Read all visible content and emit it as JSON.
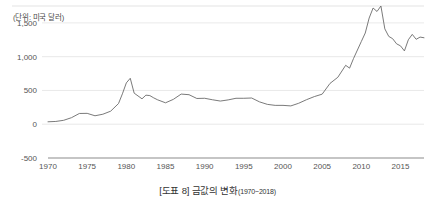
{
  "figure": {
    "unit_label": "(단위: 미국 달러)",
    "caption_main": "[도표 8] 금값의 변화",
    "caption_range": "(1970~2018)"
  },
  "colors": {
    "line": "#6b6b6b",
    "grid": "#e3e3e3",
    "axis": "#8c8c8c",
    "text": "#555555",
    "background": "#ffffff"
  },
  "chart_data": {
    "type": "line",
    "title": "[도표 8] 금값의 변화(1970~2018)",
    "subtitle": "",
    "xlabel": "",
    "ylabel": "(단위: 미국 달러)",
    "unit": "미국 달러",
    "grid": true,
    "legend": false,
    "xlim": [
      1970,
      2018
    ],
    "ylim": [
      -500,
      1750
    ],
    "yticks": [
      -500,
      0,
      500,
      1000,
      1500
    ],
    "ytick_labels": [
      "-500",
      "0",
      "500",
      "1,000",
      "1,500"
    ],
    "xticks": [
      1970,
      1975,
      1980,
      1985,
      1990,
      1995,
      2000,
      2005,
      2010,
      2015
    ],
    "xtick_labels": [
      "1970",
      "1975",
      "1980",
      "1985",
      "1990",
      "1995",
      "2000",
      "2005",
      "2010",
      "2015"
    ],
    "series": [
      {
        "name": "금값",
        "x": [
          1970,
          1971,
          1972,
          1973,
          1974,
          1975,
          1976,
          1977,
          1978,
          1979,
          1979.5,
          1980,
          1980.5,
          1981,
          1982,
          1982.5,
          1983,
          1983.5,
          1984,
          1985,
          1986,
          1987,
          1988,
          1989,
          1990,
          1991,
          1992,
          1993,
          1994,
          1995,
          1996,
          1997,
          1998,
          1999,
          2000,
          2001,
          2002,
          2003,
          2004,
          2005,
          2006,
          2007,
          2008,
          2008.5,
          2009,
          2010,
          2010.5,
          2011,
          2011.5,
          2012,
          2012.5,
          2013,
          2013.5,
          2014,
          2014.5,
          2015,
          2015.5,
          2016,
          2016.5,
          2017,
          2017.5,
          2018
        ],
        "y": [
          36,
          41,
          58,
          97,
          159,
          161,
          125,
          148,
          193,
          306,
          450,
          612,
          680,
          460,
          376,
          430,
          424,
          390,
          361,
          317,
          368,
          446,
          437,
          381,
          384,
          362,
          343,
          360,
          384,
          384,
          388,
          331,
          294,
          279,
          279,
          271,
          310,
          363,
          409,
          445,
          604,
          695,
          872,
          830,
          972,
          1225,
          1350,
          1572,
          1720,
          1669,
          1750,
          1411,
          1300,
          1266,
          1190,
          1160,
          1085,
          1250,
          1330,
          1257,
          1290,
          1280
        ],
        "color": "#6b6b6b"
      }
    ],
    "annotations": [
      {
        "label": "1980 spike peak",
        "x": 1980.5,
        "y": 680
      },
      {
        "label": "2011-2012 all-time high",
        "x": 2012.5,
        "y": 1750
      }
    ]
  }
}
